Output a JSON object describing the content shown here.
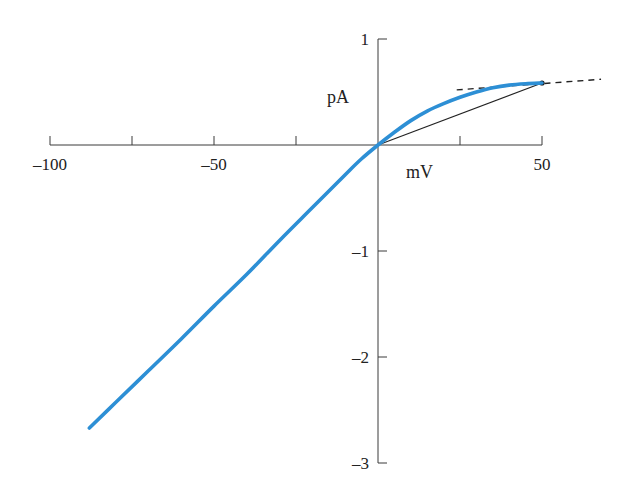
{
  "chart_data": {
    "type": "line",
    "title": "",
    "xlabel": "mV",
    "ylabel": "pA",
    "xlim": [
      -100,
      50
    ],
    "ylim": [
      -3,
      1
    ],
    "grid": false,
    "legend": "none",
    "x_ticks": [
      -100,
      -75,
      -50,
      -25,
      0,
      25,
      50
    ],
    "x_tick_labels": [
      {
        "value": -100,
        "label": "–100"
      },
      {
        "value": -50,
        "label": "–50"
      },
      {
        "value": 50,
        "label": "50"
      }
    ],
    "y_ticks": [
      1,
      -1,
      -2,
      -3
    ],
    "y_tick_labels": [
      {
        "value": 1,
        "label": "1"
      },
      {
        "value": -1,
        "label": "–1"
      },
      {
        "value": -2,
        "label": "–2"
      },
      {
        "value": -3,
        "label": "–3"
      }
    ],
    "series": [
      {
        "name": "I-V curve",
        "color": "#2d8fd5",
        "x": [
          -88,
          -80,
          -70,
          -60,
          -50,
          -40,
          -30,
          -20,
          -10,
          -5,
          0,
          5,
          10,
          15,
          20,
          25,
          30,
          35,
          40,
          45,
          50
        ],
        "y": [
          -2.67,
          -2.43,
          -2.13,
          -1.83,
          -1.52,
          -1.22,
          -0.9,
          -0.59,
          -0.28,
          -0.13,
          0.0,
          0.12,
          0.23,
          0.32,
          0.39,
          0.45,
          0.5,
          0.54,
          0.565,
          0.578,
          0.585
        ]
      }
    ],
    "annotations": [
      {
        "type": "chord",
        "from": [
          0,
          0
        ],
        "to": [
          50,
          0.585
        ],
        "color": "#222222"
      },
      {
        "type": "tangent-dashed",
        "from": [
          24,
          0.52
        ],
        "to": [
          68,
          0.62
        ],
        "color": "#222222"
      },
      {
        "type": "point",
        "at": [
          50,
          0.585
        ],
        "color": "#111111"
      }
    ]
  }
}
